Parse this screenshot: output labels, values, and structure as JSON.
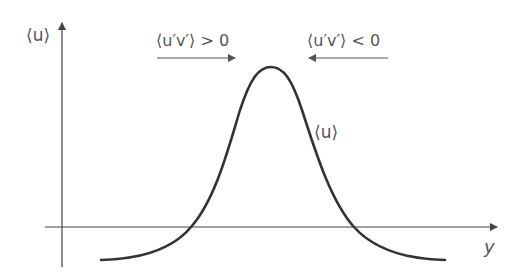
{
  "diagram": {
    "y_axis_label": "⟨u⟩",
    "x_axis_label": "y",
    "curve_label": "⟨u⟩",
    "left_flux_label": "⟨u′v′⟩ > 0",
    "right_flux_label": "⟨u′v′⟩ < 0",
    "left_arrow_direction": "right",
    "right_arrow_direction": "left",
    "curve_shape": "bell-shaped profile with peak at center, negative tails crossing the y-axis line",
    "colors": {
      "curve": "#333333",
      "axes": "#444444",
      "arrows": "#555555",
      "text": "#555555",
      "background": "#ffffff"
    }
  }
}
